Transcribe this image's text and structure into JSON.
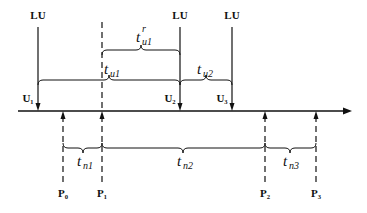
{
  "diagram": {
    "axis": {
      "y": 111,
      "x_start": 18,
      "x_end": 352
    },
    "top_labels": [
      {
        "text": "LU",
        "x": 38
      },
      {
        "text": "LU",
        "x": 180
      },
      {
        "text": "LU",
        "x": 232
      }
    ],
    "u_markers": [
      {
        "text": "U₁",
        "x": 38
      },
      {
        "text": "U₂",
        "x": 180
      },
      {
        "text": "U₃",
        "x": 232
      }
    ],
    "p_markers": [
      {
        "text": "P₀",
        "x": 63
      },
      {
        "text": "P₁",
        "x": 102
      },
      {
        "text": "P₂",
        "x": 265
      },
      {
        "text": "P₃",
        "x": 316
      }
    ],
    "intervals": {
      "t_u1_r": {
        "base": "t",
        "sub": "u1",
        "sup": "r"
      },
      "t_u1": {
        "base": "t",
        "sub": "u1"
      },
      "t_u2": {
        "base": "t",
        "sub": "u2"
      },
      "t_n1": {
        "base": "t",
        "sub": "n1"
      },
      "t_n2": {
        "base": "t",
        "sub": "n2"
      },
      "t_n3": {
        "base": "t",
        "sub": "n3"
      }
    }
  }
}
